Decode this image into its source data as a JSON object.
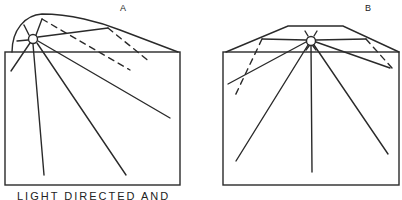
{
  "diagram": {
    "panels": [
      {
        "id": "A",
        "label": "A"
      },
      {
        "id": "B",
        "label": "B"
      }
    ],
    "caption": "LIGHT DIRECTED AND",
    "colors": {
      "stroke": "#2a2a2a",
      "background": "#ffffff"
    }
  }
}
